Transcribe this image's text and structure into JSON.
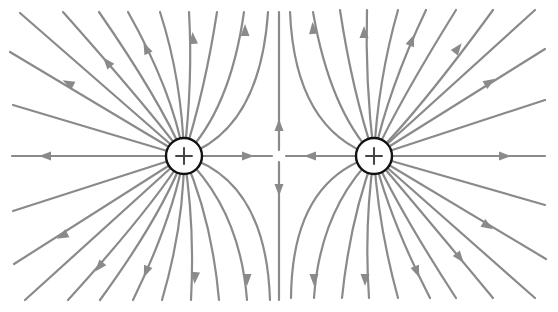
{
  "diagram": {
    "colors": {
      "field_line": "#8a8a8a",
      "charge_outline": "#111111",
      "charge_sign": "#444444",
      "background": "#ffffff"
    },
    "charges": [
      {
        "id": "left",
        "sign": "+",
        "cx": 184,
        "cy": 156,
        "r": 18
      },
      {
        "id": "right",
        "sign": "+",
        "cx": 374,
        "cy": 156,
        "r": 18
      }
    ],
    "field_lines": [
      {
        "d": "M184,156 L12,156",
        "arrow": [
          45,
          156,
          180
        ]
      },
      {
        "d": "M184,156 L13,105",
        "arrow": null
      },
      {
        "d": "M184,156 L10,52",
        "arrow": [
          68,
          83,
          -152
        ]
      },
      {
        "d": "M184,156 L20,13",
        "arrow": null
      },
      {
        "d": "M184,156 Q150,110 63,12",
        "arrow": [
          107,
          62,
          -130
        ]
      },
      {
        "d": "M184,156 Q160,100 99,12",
        "arrow": null
      },
      {
        "d": "M184,156 Q172,90 128,12",
        "arrow": [
          146,
          48,
          -115
        ]
      },
      {
        "d": "M184,156 Q182,80 160,12",
        "arrow": null
      },
      {
        "d": "M184,156 Q193,80 189,12",
        "arrow": [
          193,
          38,
          -95
        ]
      },
      {
        "d": "M184,156 Q205,90 217,12",
        "arrow": null
      },
      {
        "d": "M184,156 Q230,110 244,12",
        "arrow": [
          245,
          30,
          -90
        ]
      },
      {
        "d": "M184,156 Q260,130 268,12",
        "arrow": null
      },
      {
        "d": "M184,156 L13,211",
        "arrow": null
      },
      {
        "d": "M184,156 L14,264",
        "arrow": [
          62,
          236,
          152
        ]
      },
      {
        "d": "M184,156 L25,300",
        "arrow": null
      },
      {
        "d": "M184,156 Q150,210 68,300",
        "arrow": [
          99,
          267,
          130
        ]
      },
      {
        "d": "M184,156 Q162,215 100,300",
        "arrow": null
      },
      {
        "d": "M184,156 Q172,220 133,300",
        "arrow": [
          146,
          272,
          112
        ]
      },
      {
        "d": "M184,156 Q184,225 162,300",
        "arrow": null
      },
      {
        "d": "M184,156 Q195,225 191,300",
        "arrow": [
          195,
          278,
          95
        ]
      },
      {
        "d": "M184,156 Q212,220 219,300",
        "arrow": null
      },
      {
        "d": "M184,156 Q240,210 247,300",
        "arrow": [
          247,
          280,
          90
        ]
      },
      {
        "d": "M184,156 Q266,180 270,300",
        "arrow": null
      },
      {
        "d": "M184,156 L272,156",
        "arrow": [
          248,
          156,
          0
        ]
      },
      {
        "d": "M279,150 L279,12",
        "arrow": [
          279,
          125,
          -90
        ]
      },
      {
        "d": "M279,162 L279,300",
        "arrow": [
          279,
          190,
          90
        ]
      },
      {
        "d": "M374,156 L286,156",
        "arrow": [
          310,
          156,
          180
        ]
      },
      {
        "d": "M374,156 L545,156",
        "arrow": [
          505,
          156,
          0
        ]
      },
      {
        "d": "M374,156 L545,100",
        "arrow": null
      },
      {
        "d": "M374,156 L545,49",
        "arrow": [
          490,
          82,
          -32
        ]
      },
      {
        "d": "M374,156 L535,10",
        "arrow": null
      },
      {
        "d": "M374,156 Q420,110 493,10",
        "arrow": [
          458,
          48,
          -52
        ]
      },
      {
        "d": "M374,156 Q400,100 456,10",
        "arrow": null
      },
      {
        "d": "M374,156 Q388,90 426,10",
        "arrow": [
          412,
          40,
          -68
        ]
      },
      {
        "d": "M374,156 Q378,80 398,10",
        "arrow": null
      },
      {
        "d": "M374,156 Q365,80 367,10",
        "arrow": [
          364,
          32,
          -90
        ]
      },
      {
        "d": "M374,156 Q352,90 340,10",
        "arrow": null
      },
      {
        "d": "M374,156 Q330,110 313,12",
        "arrow": [
          313,
          28,
          -95
        ]
      },
      {
        "d": "M374,156 Q295,130 290,12",
        "arrow": null
      },
      {
        "d": "M374,156 L545,205",
        "arrow": null
      },
      {
        "d": "M374,156 L546,259",
        "arrow": [
          488,
          226,
          32
        ]
      },
      {
        "d": "M374,156 L535,298",
        "arrow": null
      },
      {
        "d": "M374,156 Q420,210 493,298",
        "arrow": [
          460,
          258,
          52
        ]
      },
      {
        "d": "M374,156 Q402,215 456,298",
        "arrow": null
      },
      {
        "d": "M374,156 Q390,220 430,298",
        "arrow": [
          417,
          272,
          68
        ]
      },
      {
        "d": "M374,156 Q378,225 398,298",
        "arrow": null
      },
      {
        "d": "M374,156 Q364,225 369,298",
        "arrow": [
          365,
          280,
          90
        ]
      },
      {
        "d": "M374,156 Q350,220 342,298",
        "arrow": null
      },
      {
        "d": "M374,156 Q320,210 314,298",
        "arrow": [
          314,
          280,
          90
        ]
      },
      {
        "d": "M374,156 Q292,180 291,298",
        "arrow": null
      }
    ]
  }
}
